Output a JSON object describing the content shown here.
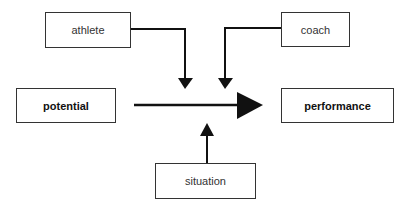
{
  "diagram": {
    "nodes": {
      "athlete": "athlete",
      "coach": "coach",
      "potential": "potential",
      "performance": "performance",
      "situation": "situation"
    },
    "edges": [
      {
        "from": "potential",
        "to": "performance",
        "type": "main-arrow"
      },
      {
        "from": "athlete",
        "to": "main-arrow",
        "type": "influence"
      },
      {
        "from": "coach",
        "to": "main-arrow",
        "type": "influence"
      },
      {
        "from": "situation",
        "to": "main-arrow",
        "type": "influence"
      }
    ]
  }
}
